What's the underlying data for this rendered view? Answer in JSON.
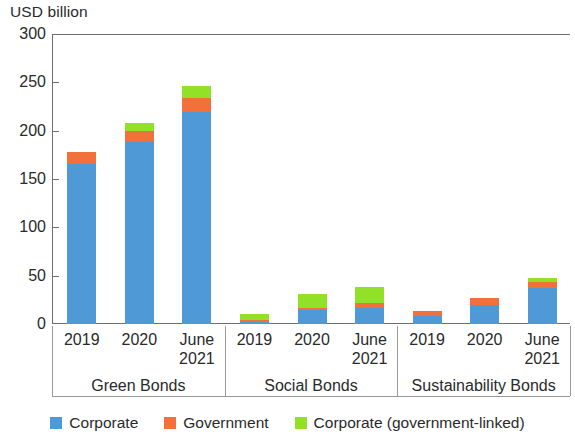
{
  "chart_data": {
    "type": "bar",
    "subtype": "stacked-bar-grouped",
    "title": "",
    "ylabel": "USD billion",
    "xlabel": "",
    "ylim": [
      0,
      300
    ],
    "yticks": [
      0,
      50,
      100,
      150,
      200,
      250,
      300
    ],
    "ytick_labels": [
      "0",
      "50",
      "100",
      "150",
      "200",
      "250",
      "300"
    ],
    "grid": false,
    "legend_position": "bottom",
    "categories": [
      "2019",
      "2020",
      "June 2021"
    ],
    "groups": [
      "Green Bonds",
      "Social Bonds",
      "Sustainability Bonds"
    ],
    "series": [
      {
        "name": "Corporate",
        "color": "#4f9ad6",
        "values": {
          "Green Bonds": [
            166,
            188,
            219
          ],
          "Social Bonds": [
            2,
            14,
            17
          ],
          "Sustainability Bonds": [
            8,
            20,
            37
          ]
        }
      },
      {
        "name": "Government",
        "color": "#f2703c",
        "values": {
          "Green Bonds": [
            12,
            12,
            15
          ],
          "Social Bonds": [
            2,
            3,
            5
          ],
          "Sustainability Bonds": [
            5,
            7,
            6
          ]
        }
      },
      {
        "name": "Corporate (government-linked)",
        "color": "#92e028",
        "values": {
          "Green Bonds": [
            0,
            8,
            12
          ],
          "Social Bonds": [
            6,
            14,
            16
          ],
          "Sustainability Bonds": [
            0,
            0,
            5
          ]
        }
      }
    ],
    "totals": {
      "Green Bonds": [
        178,
        208,
        246
      ],
      "Social Bonds": [
        10,
        31,
        38
      ],
      "Sustainability Bonds": [
        13,
        27,
        48
      ]
    }
  },
  "axis": {
    "y_title": "USD billion"
  },
  "legend": {
    "items": [
      {
        "label": "Corporate",
        "color": "#4f9ad6"
      },
      {
        "label": "Government",
        "color": "#f2703c"
      },
      {
        "label": "Corporate (government-linked)",
        "color": "#92e028"
      }
    ]
  }
}
